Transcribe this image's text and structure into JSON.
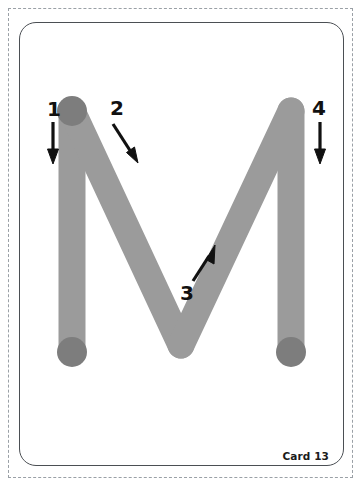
{
  "card": {
    "letter": "M",
    "card_number_label": "Card 13",
    "stroke_labels": [
      "1",
      "2",
      "3",
      "4"
    ],
    "colors": {
      "stroke_gray": "#9b9b9b",
      "start_dot_gray": "#7d7d7d",
      "arrow_black": "#111111",
      "card_border": "#4b4f54",
      "cut_guide": "#9aa0a6",
      "background": "#ffffff"
    },
    "strokes": [
      {
        "number": "1",
        "name": "left-vertical-downstroke",
        "direction": "down"
      },
      {
        "number": "2",
        "name": "upper-left-diagonal-downstroke",
        "direction": "down-right"
      },
      {
        "number": "3",
        "name": "lower-right-diagonal-upstroke",
        "direction": "up-right"
      },
      {
        "number": "4",
        "name": "right-vertical-downstroke",
        "direction": "down"
      }
    ],
    "start_dots": [
      {
        "name": "stroke-1-start-dot",
        "position": "top-left"
      },
      {
        "name": "stroke-1-end-dot",
        "position": "bottom-left"
      },
      {
        "name": "stroke-4-end-dot",
        "position": "bottom-right"
      }
    ]
  }
}
